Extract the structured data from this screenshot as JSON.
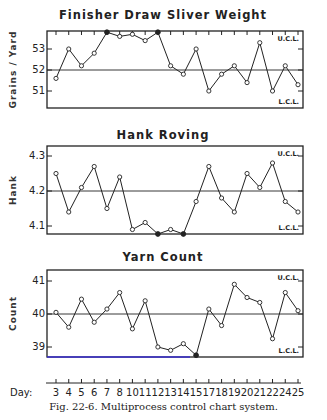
{
  "caption": "Fig. 22-6.   Multiprocess control chart system.",
  "day_axis_label": "Day:",
  "colors": {
    "ink": "#222222",
    "lcl_highlight": "#3a2fd0"
  },
  "chart_data": [
    {
      "type": "line",
      "title": "Finisher Draw  Sliver Weight",
      "xlabel": "Day",
      "ylabel": "Grains / Yard",
      "x": [
        3,
        4,
        5,
        6,
        7,
        8,
        10,
        11,
        12,
        13,
        14,
        15,
        17,
        18,
        19,
        20,
        21,
        22,
        24,
        25
      ],
      "values": [
        51.6,
        53.0,
        52.2,
        52.8,
        53.8,
        53.6,
        53.7,
        53.4,
        53.8,
        52.2,
        51.8,
        53.0,
        51.0,
        51.8,
        52.2,
        51.4,
        53.3,
        51.0,
        52.2,
        51.3
      ],
      "out_of_control_indices": [
        4,
        8
      ],
      "center_line": 52,
      "ucl_label": "U.C.L.",
      "lcl_label": "L.C.L.",
      "yticks": [
        51,
        52,
        53
      ],
      "ylim": [
        50.15,
        53.8
      ]
    },
    {
      "type": "line",
      "title": "Hank  Roving",
      "xlabel": "Day",
      "ylabel": "Hank",
      "x": [
        3,
        4,
        5,
        6,
        7,
        8,
        10,
        11,
        12,
        13,
        14,
        15,
        17,
        18,
        19,
        20,
        21,
        22,
        24,
        25
      ],
      "values": [
        4.25,
        4.14,
        4.21,
        4.27,
        4.15,
        4.24,
        4.09,
        4.11,
        4.06,
        4.09,
        4.07,
        4.17,
        4.27,
        4.18,
        4.14,
        4.25,
        4.21,
        4.28,
        4.17,
        4.14
      ],
      "out_of_control_indices": [
        8,
        10
      ],
      "center_line": 4.2,
      "ucl_label": "U.C.L.",
      "lcl_label": "L.C.L.",
      "yticks": [
        4.1,
        4.2,
        4.3
      ],
      "ylim": [
        4.07,
        4.33
      ]
    },
    {
      "type": "line",
      "title": "Yarn  Count",
      "xlabel": "Day",
      "ylabel": "Count",
      "x": [
        3,
        4,
        5,
        6,
        7,
        8,
        10,
        11,
        12,
        13,
        14,
        15,
        17,
        18,
        19,
        20,
        21,
        22,
        24,
        25
      ],
      "values": [
        40.05,
        39.6,
        40.45,
        39.75,
        40.15,
        40.65,
        39.55,
        40.4,
        39.0,
        38.9,
        39.1,
        38.75,
        40.15,
        39.65,
        40.9,
        40.5,
        40.35,
        39.25,
        40.65,
        40.1
      ],
      "out_of_control_indices": [
        11
      ],
      "center_line": 40,
      "ucl_label": "U.C.L.",
      "lcl_label": "L.C.L.",
      "yticks": [
        39,
        40,
        41
      ],
      "ylim": [
        38.75,
        41.35
      ]
    }
  ]
}
